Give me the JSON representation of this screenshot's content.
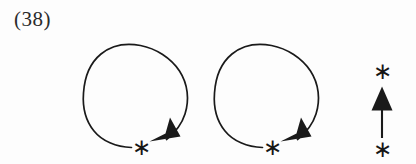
{
  "figure": {
    "equation_label": "(38)",
    "ink_color": "#1a1a1a",
    "background_color": "#fdfdfd",
    "elements": [
      {
        "name": "circular-arrow-left",
        "kind": "clockwise-circular-arrow",
        "marker": "*",
        "marker_label": "asterisk"
      },
      {
        "name": "circular-arrow-right",
        "kind": "clockwise-circular-arrow",
        "marker": "*",
        "marker_label": "asterisk"
      },
      {
        "name": "straight-arrow-up",
        "kind": "upward-straight-arrow",
        "marker_head": "*",
        "marker_tail": "*",
        "marker_label": "asterisk"
      }
    ],
    "asterisk_glyph": "∗",
    "asterisks": {
      "circle_left": "∗",
      "circle_right": "∗",
      "arrow_top": "∗",
      "arrow_bottom": "∗"
    }
  }
}
